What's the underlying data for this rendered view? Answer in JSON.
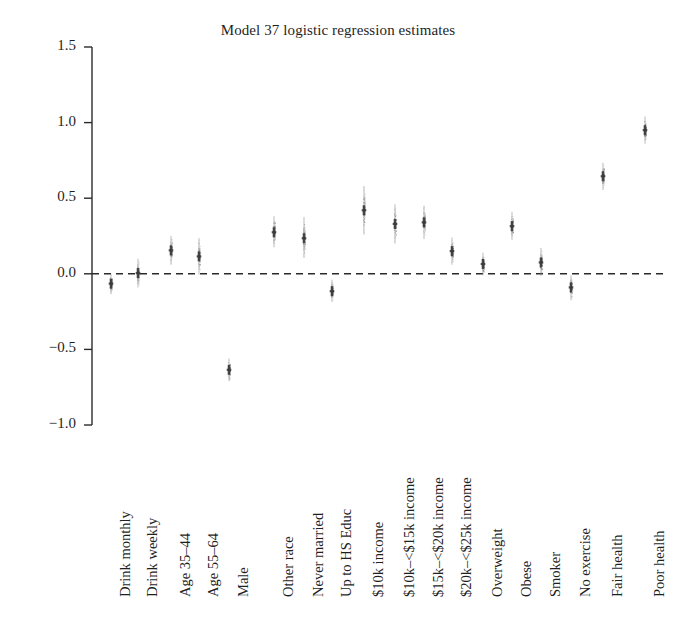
{
  "chart_data": {
    "type": "scatter",
    "title": "Model 37 logistic regression estimates",
    "xlabel": "",
    "ylabel": "",
    "ylim": [
      -1.0,
      1.5
    ],
    "yticks": [
      "1.5",
      "1.0",
      "0.5",
      "0.0",
      "-0.5",
      "-1.0"
    ],
    "ytick_values": [
      1.5,
      1.0,
      0.5,
      0.0,
      -0.5,
      -1.0
    ],
    "grid": false,
    "legend": "none",
    "zero_reference_line": 0.0,
    "zero_line_style": "dashed",
    "point_style": "vertical posterior draw cloud with dark median band",
    "categories": [
      "Drink monthly",
      "Drink weekly",
      "Age 35–44",
      "Age 55–64",
      "Male",
      "Other race",
      "Never married",
      "Up to HS Educ",
      "$10k income",
      "$10k–<$15k income",
      "$15k–<$20k income",
      "$20k–<$25k income",
      "Overweight",
      "Obese",
      "Smoker",
      "No exercise",
      "Fair health",
      "Poor health"
    ],
    "values": [
      -0.065,
      0.005,
      0.155,
      0.115,
      -0.635,
      0.275,
      0.235,
      -0.115,
      0.42,
      0.33,
      0.34,
      0.15,
      0.065,
      0.315,
      0.075,
      -0.09,
      0.645,
      0.95
    ],
    "spread_low": [
      -0.135,
      -0.09,
      0.06,
      -0.005,
      -0.71,
      0.175,
      0.105,
      -0.185,
      0.26,
      0.2,
      0.23,
      0.06,
      -0.01,
      0.225,
      -0.015,
      -0.175,
      0.555,
      0.86
    ],
    "spread_high": [
      0.0,
      0.1,
      0.25,
      0.235,
      -0.56,
      0.38,
      0.375,
      -0.04,
      0.58,
      0.46,
      0.45,
      0.24,
      0.14,
      0.41,
      0.17,
      -0.01,
      0.735,
      1.04
    ],
    "x_pixels": [
      111,
      138,
      171,
      199,
      229,
      274,
      304,
      332,
      364,
      395,
      424,
      452,
      483,
      512,
      541,
      571,
      603,
      645
    ],
    "colors": {
      "point": "#3a3a3a",
      "cloud": "#8c8c8c",
      "axis": "#2b2b2b",
      "zero_line": "#2b2b2b",
      "background": "#ffffff"
    }
  },
  "axis": {
    "spine_x": 92,
    "y_top_px": 47,
    "y_bottom_px": 425,
    "plot_right_px": 668
  }
}
